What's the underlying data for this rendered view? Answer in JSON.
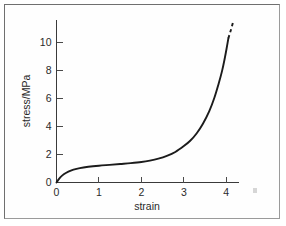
{
  "figure": {
    "background_color": "#fefefe",
    "frame_color": "#9a9a9a",
    "curve_color": "#1b1b1b",
    "axis_color": "#3a3a3a"
  },
  "chart_data": {
    "type": "line",
    "title": "",
    "xlabel": "strain",
    "ylabel": "stress/MPa",
    "xlim": [
      0,
      4.3
    ],
    "ylim": [
      0,
      11.6
    ],
    "grid": false,
    "legend": null,
    "x_ticks": [
      0,
      1,
      2,
      3,
      4
    ],
    "x_tick_labels": [
      "0",
      "1",
      "2",
      "3",
      "4"
    ],
    "y_ticks": [
      0,
      2,
      4,
      6,
      8,
      10
    ],
    "y_tick_labels": [
      "0",
      "2",
      "4",
      "6",
      "8",
      "10"
    ],
    "series": [
      {
        "name": "stress-strain",
        "style": "solid",
        "x": [
          0.0,
          0.05,
          0.1,
          0.18,
          0.28,
          0.4,
          0.55,
          0.75,
          1.0,
          1.25,
          1.5,
          1.75,
          2.0,
          2.2,
          2.4,
          2.6,
          2.8,
          3.0,
          3.15,
          3.3,
          3.45,
          3.6,
          3.72,
          3.82,
          3.9,
          3.96,
          4.01,
          4.05
        ],
        "y": [
          0.0,
          0.22,
          0.4,
          0.6,
          0.78,
          0.92,
          1.03,
          1.12,
          1.2,
          1.26,
          1.32,
          1.38,
          1.46,
          1.56,
          1.7,
          1.9,
          2.18,
          2.6,
          2.98,
          3.5,
          4.2,
          5.1,
          6.05,
          7.05,
          7.95,
          8.8,
          9.6,
          10.3
        ]
      },
      {
        "name": "extrapolation",
        "style": "dashed",
        "x": [
          4.05,
          4.09,
          4.13,
          4.16
        ],
        "y": [
          10.3,
          10.7,
          11.1,
          11.45
        ]
      }
    ],
    "annotations": []
  }
}
